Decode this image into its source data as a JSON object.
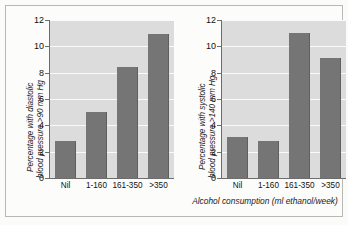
{
  "figure": {
    "background_color": "#fbfbfa",
    "bar_color": "#757575",
    "plot_background_color": "#dcdcdc",
    "gridline_color": "#fafafa",
    "axis_color": "#6d6d6d",
    "shared_xaxis_caption": "Alcohol consumption (ml ethanol/week)"
  },
  "chart_data": [
    {
      "type": "bar",
      "title": "",
      "panel": "left",
      "ylabel": "Percentage with diastolic blood pressure >90 mm Hg",
      "ylabel_line1": "Percentage with diastolic",
      "ylabel_line2": "blood pressure >90 mm Hg",
      "xlabel": "Alcohol consumption (ml ethanol/week)",
      "categories": [
        "Nil",
        "1-160",
        "161-350",
        ">350"
      ],
      "values": [
        2.8,
        5.0,
        8.4,
        10.9
      ],
      "ylim": [
        0,
        12
      ],
      "yticks": [
        0,
        2,
        4,
        6,
        8,
        10,
        12
      ],
      "ytick_labels": [
        "0",
        "2",
        "4",
        "6",
        "8",
        "10",
        "12"
      ],
      "grid": true,
      "legend": "none"
    },
    {
      "type": "bar",
      "title": "",
      "panel": "right",
      "ylabel": "Percentage with systolic blood pressure >140 mm Hg",
      "ylabel_line1": "Percentage with systolic",
      "ylabel_line2": "blood pressure >140 mm Hg",
      "xlabel": "Alcohol consumption (ml ethanol/week)",
      "categories": [
        "Nil",
        "1-160",
        "161-350",
        ">350"
      ],
      "values": [
        3.1,
        2.8,
        11.0,
        9.1
      ],
      "ylim": [
        0,
        12
      ],
      "yticks": [
        0,
        2,
        4,
        6,
        8,
        10,
        12
      ],
      "ytick_labels": [
        "0",
        "2",
        "4",
        "6",
        "8",
        "10",
        "12"
      ],
      "grid": true,
      "legend": "none"
    }
  ]
}
